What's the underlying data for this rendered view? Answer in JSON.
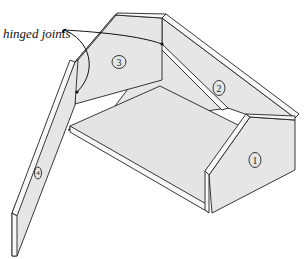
{
  "figure": {
    "annotation": {
      "label": "hinged joints",
      "points_to": [
        "joint between panel 3 and panel 2",
        "joint between panel 4 and panel 3"
      ]
    },
    "panels": [
      {
        "id": "1",
        "label": "1",
        "position": "front-right end panel"
      },
      {
        "id": "2",
        "label": "2",
        "position": "back-right side panel"
      },
      {
        "id": "3",
        "label": "3",
        "position": "back-left end panel"
      },
      {
        "id": "4",
        "label": "4",
        "position": "swung-open left side panel"
      }
    ],
    "floor": {
      "label": "",
      "position": "base / floor board"
    },
    "colors": {
      "panel_fill": "#e6e6e6",
      "edge_fill": "#f7f7f7",
      "line": "#222222",
      "background": "#ffffff"
    }
  }
}
